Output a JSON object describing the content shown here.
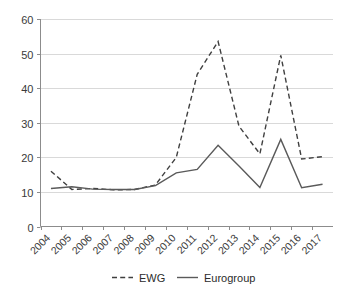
{
  "chart_data": {
    "type": "line",
    "title": "",
    "subtitle": "",
    "xlabel": "",
    "ylabel": "",
    "categories": [
      "2004",
      "2005",
      "2006",
      "2007",
      "2008",
      "2009",
      "2010",
      "2011",
      "2012",
      "2013",
      "2014",
      "2015",
      "2016",
      "2017"
    ],
    "series": [
      {
        "name": "EWG",
        "style": "dashed",
        "color": "#3f3f3f",
        "values": [
          16.0,
          10.7,
          11.0,
          10.6,
          10.7,
          12.0,
          20.0,
          44.0,
          53.5,
          29.0,
          21.0,
          49.5,
          19.5,
          20.2
        ]
      },
      {
        "name": "Eurogroup",
        "style": "solid",
        "color": "#5a5a5a",
        "values": [
          11.0,
          11.5,
          10.8,
          10.7,
          10.7,
          11.8,
          15.5,
          16.5,
          23.5,
          17.5,
          11.3,
          25.2,
          11.2,
          12.2
        ]
      }
    ],
    "ylim": [
      0,
      60
    ],
    "yticks": [
      0,
      10,
      20,
      30,
      40,
      50,
      60
    ],
    "xlim_labels": [
      "2004",
      "2017"
    ],
    "grid": true,
    "grid_axis": "y",
    "legend_position": "bottom",
    "legend_entries": [
      {
        "label": "EWG",
        "style": "dashed"
      },
      {
        "label": "Eurogroup",
        "style": "solid"
      }
    ]
  },
  "axis": {
    "y_tick_labels": [
      "60",
      "50",
      "40",
      "30",
      "20",
      "10",
      "0"
    ],
    "x_tick_labels": [
      "2004",
      "2005",
      "2006",
      "2007",
      "2008",
      "2009",
      "2010",
      "2011",
      "2012",
      "2013",
      "2014",
      "2015",
      "2016",
      "2017"
    ]
  },
  "legend": {
    "ewg_label": "EWG",
    "eurogroup_label": "Eurogroup"
  },
  "colors": {
    "ewg": "#3f3f3f",
    "eurogroup": "#5a5a5a",
    "grid": "#d9d9d9",
    "axis": "#8c8c8c",
    "text": "#2b2b2b",
    "background": "#ffffff"
  }
}
